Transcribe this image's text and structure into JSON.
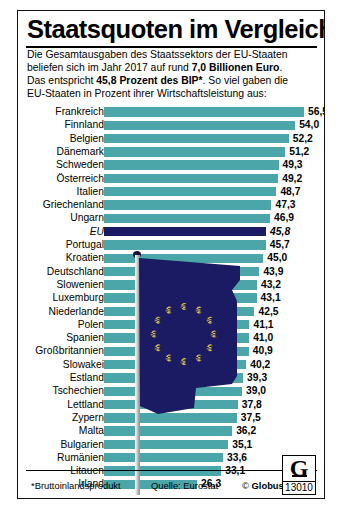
{
  "header": {
    "title": "Staatsquoten im Vergleich",
    "intro_lines": [
      "Die Gesamtausgaben des Staatssektors der EU-Staaten",
      "beliefen sich im Jahr 2017 auf rund 7,0 Billionen Euro.",
      "Das entspricht 45,8 Prozent des BIP*. So viel gaben die",
      "EU-Staaten in Prozent ihrer Wirtschaftsleistung aus:"
    ],
    "intro_bold_terms": [
      "7,0 Billionen Euro",
      "45,8 Prozent des BIP*"
    ]
  },
  "footer": {
    "footnote": "*Bruttoinlandsprodukt",
    "source": "Quelle: Eurostat",
    "copyright_prefix": "© ",
    "copyright_name": "Globus",
    "logo_letter": "G",
    "logo_number": "13010"
  },
  "colors": {
    "bar": "#4aa6a8",
    "eu_bar": "#1b1b63",
    "flag_blue": "#1b1b63",
    "flag_star": "#d8c24a",
    "text": "#000000",
    "background": "#ffffff"
  },
  "chart_data": {
    "type": "bar",
    "orientation": "horizontal",
    "title": "Staatsquoten im Vergleich",
    "subtitle": "Staatsausgaben in Prozent der Wirtschaftsleistung 2017",
    "xlabel": "Prozent des BIP",
    "ylabel": "",
    "unit": "%",
    "year": 2017,
    "xlim": [
      0,
      56.5
    ],
    "grid": false,
    "legend": null,
    "highlight_category": "EU",
    "categories": [
      "Frankreich",
      "Finnland",
      "Belgien",
      "Dänemark",
      "Schweden",
      "Österreich",
      "Italien",
      "Griechenland",
      "Ungarn",
      "EU",
      "Portugal",
      "Kroatien",
      "Deutschland",
      "Slowenien",
      "Luxemburg",
      "Niederlande",
      "Polen",
      "Spanien",
      "Großbritannien",
      "Slowakei",
      "Estland",
      "Tschechien",
      "Lettland",
      "Zypern",
      "Malta",
      "Bulgarien",
      "Rumänien",
      "Litauen",
      "Irland"
    ],
    "values": [
      56.5,
      54.0,
      52.2,
      51.2,
      49.3,
      49.2,
      48.7,
      47.3,
      46.9,
      45.8,
      45.7,
      45.0,
      43.9,
      43.2,
      43.1,
      42.5,
      41.1,
      41.0,
      40.9,
      40.2,
      39.3,
      39.0,
      37.8,
      37.5,
      36.2,
      35.1,
      33.6,
      33.1,
      26.3
    ],
    "value_labels": [
      "56,5",
      "54,0",
      "52,2",
      "51,2",
      "49,3",
      "49,2",
      "48,7",
      "47,3",
      "46,9",
      "45,8",
      "45,7",
      "45,0",
      "43,9",
      "43,2",
      "43,1",
      "42,5",
      "41,1",
      "41,0",
      "40,9",
      "40,2",
      "39,3",
      "39,0",
      "37,8",
      "37,5",
      "36,2",
      "35,1",
      "33,6",
      "33,1",
      "26,3"
    ]
  }
}
